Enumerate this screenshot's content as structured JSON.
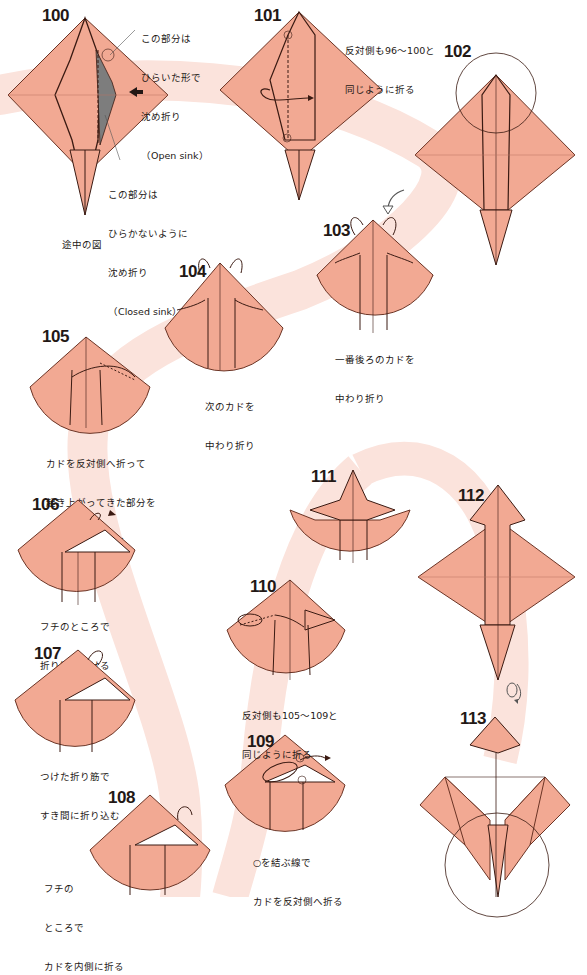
{
  "page": {
    "colors": {
      "paper": "#f2a993",
      "paper_stroke": "#6b3425",
      "band": "#fbe3dc",
      "gray_sink": "#7d7d7d",
      "text": "#231815"
    }
  },
  "steps": [
    {
      "num": "100",
      "captions": [
        {
          "id": "open_sink",
          "lines": [
            "この部分は",
            "ひらいた形で",
            "沈め折り",
            "（Open sink）"
          ]
        },
        {
          "id": "closed_sink",
          "lines": [
            "この部分は",
            "ひらかないように",
            "沈め折り",
            "（Closed sink）"
          ]
        },
        {
          "id": "in_progress",
          "lines": [
            "途中の図"
          ]
        }
      ]
    },
    {
      "num": "101",
      "captions": [
        {
          "id": "repeat",
          "lines": [
            "反対側も96〜100と",
            "同じように折る"
          ]
        }
      ]
    },
    {
      "num": "102",
      "captions": []
    },
    {
      "num": "103",
      "captions": [
        {
          "id": "main",
          "lines": [
            "一番後ろのカドを",
            "中わり折り"
          ]
        }
      ]
    },
    {
      "num": "104",
      "captions": [
        {
          "id": "main",
          "lines": [
            "次のカドを",
            "中わり折り"
          ]
        }
      ]
    },
    {
      "num": "105",
      "captions": [
        {
          "id": "main",
          "lines": [
            "カドを反対側へ折って",
            "起き上がってきた部分を",
            "つぶすように折る"
          ]
        }
      ]
    },
    {
      "num": "106",
      "captions": [
        {
          "id": "main",
          "lines": [
            "フチのところで",
            "折り筋をつける"
          ]
        }
      ]
    },
    {
      "num": "107",
      "captions": [
        {
          "id": "main",
          "lines": [
            "つけた折り筋で",
            "すき間に折り込む"
          ]
        }
      ]
    },
    {
      "num": "108",
      "captions": [
        {
          "id": "main",
          "lines": [
            "フチの",
            "ところで",
            "カドを内側に折る"
          ]
        }
      ]
    },
    {
      "num": "109",
      "captions": [
        {
          "id": "main",
          "lines": [
            "○を結ぶ線で",
            "カドを反対側へ折る"
          ]
        }
      ]
    },
    {
      "num": "110",
      "captions": [
        {
          "id": "main",
          "lines": [
            "反対側も105〜109と",
            "同じように折る"
          ]
        }
      ]
    },
    {
      "num": "111",
      "captions": []
    },
    {
      "num": "112",
      "captions": []
    },
    {
      "num": "113",
      "captions": []
    }
  ]
}
